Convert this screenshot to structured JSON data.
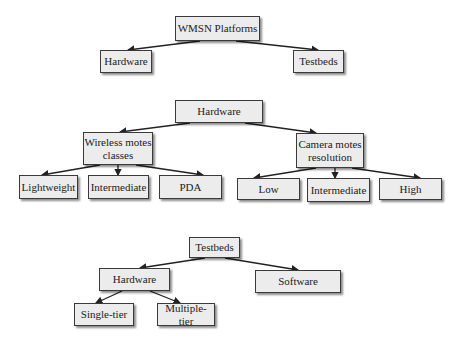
{
  "trees": [
    {
      "name": "wmsn-platforms",
      "root": "WMSN Platforms",
      "children": [
        "Hardware",
        "Testbeds"
      ]
    },
    {
      "name": "hardware",
      "root": "Hardware",
      "children": [
        {
          "label": "Wireless motes classes",
          "children": [
            "Lightweight",
            "Intermediate",
            "PDA"
          ]
        },
        {
          "label": "Camera motes resolution",
          "children": [
            "Low",
            "Intermediate",
            "High"
          ]
        }
      ]
    },
    {
      "name": "testbeds",
      "root": "Testbeds",
      "children": [
        {
          "label": "Hardware",
          "children": [
            "Single-tier",
            "Multiple-tier"
          ]
        },
        {
          "label": "Software",
          "children": []
        }
      ]
    }
  ],
  "nodes": {
    "t1_root": "WMSN Platforms",
    "t1_hardware": "Hardware",
    "t1_testbeds": "Testbeds",
    "t2_root": "Hardware",
    "t2_wireless_l1": "Wireless motes",
    "t2_wireless_l2": "classes",
    "t2_lightweight": "Lightweight",
    "t2_intermediate_a": "Intermediate",
    "t2_pda": "PDA",
    "t2_camera_l1": "Camera motes",
    "t2_camera_l2": "resolution",
    "t2_low": "Low",
    "t2_intermediate_b": "Intermediate",
    "t2_high": "High",
    "t3_root": "Testbeds",
    "t3_hardware": "Hardware",
    "t3_software": "Software",
    "t3_single": "Single-tier",
    "t3_multiple": "Multiple-tier"
  },
  "colors": {
    "box_fill": "#ececec",
    "box_border": "#3a3a3a",
    "edge": "#222222"
  }
}
